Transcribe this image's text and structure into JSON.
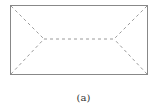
{
  "figure": {
    "caption": "(a)",
    "outline_color": "#888888",
    "dash_color": "#9a9a9a",
    "rectangle": {
      "x": 10,
      "y": 5,
      "width": 138,
      "height": 70
    },
    "left_vertex": {
      "x": 44,
      "y": 39
    },
    "right_vertex": {
      "x": 114,
      "y": 39
    }
  }
}
